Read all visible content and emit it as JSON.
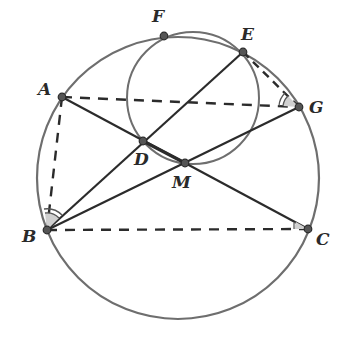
{
  "diagram": {
    "type": "geometry",
    "colors": {
      "circle": "#6e6e6e",
      "line": "#2b2b2b",
      "point": "#555555",
      "shade": "#cfcfcf",
      "background": "#ffffff"
    },
    "circles": [
      {
        "name": "circumcircle",
        "cx": 178,
        "cy": 178,
        "r": 141
      },
      {
        "name": "small-circle",
        "cx": 193,
        "cy": 98,
        "r": 66
      }
    ],
    "points": {
      "A": {
        "label": "A",
        "x": 62,
        "y": 97
      },
      "B": {
        "label": "B",
        "x": 47,
        "y": 230
      },
      "C": {
        "label": "C",
        "x": 308,
        "y": 229
      },
      "D": {
        "label": "D",
        "x": 143,
        "y": 141
      },
      "E": {
        "label": "E",
        "x": 243,
        "y": 52
      },
      "F": {
        "label": "F",
        "x": 164,
        "y": 36
      },
      "G": {
        "label": "G",
        "x": 299,
        "y": 107
      },
      "M": {
        "label": "M",
        "x": 185,
        "y": 163
      }
    },
    "solid_segments": [
      "A-C",
      "B-E",
      "B-G",
      "D-M"
    ],
    "dashed_segments": [
      "A-G",
      "A-B",
      "B-C",
      "E-G"
    ],
    "angle_marks": [
      "angle ABE (double arc)",
      "angle AGE (double arc)",
      "angle ACB (single)"
    ]
  }
}
